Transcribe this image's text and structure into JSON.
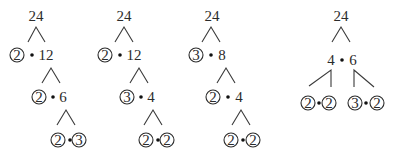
{
  "diagram": {
    "type": "factor-trees",
    "trees": [
      {
        "root": "24",
        "levels": [
          {
            "left": "2",
            "left_circled": true,
            "right": "12"
          },
          {
            "left": "2",
            "left_circled": true,
            "right": "6"
          },
          {
            "left": "2",
            "left_circled": true,
            "right": "3",
            "right_circled": true
          }
        ]
      },
      {
        "root": "24",
        "levels": [
          {
            "left": "2",
            "left_circled": true,
            "right": "12"
          },
          {
            "left": "3",
            "left_circled": true,
            "right": "4"
          },
          {
            "left": "2",
            "left_circled": true,
            "right": "2",
            "right_circled": true
          }
        ]
      },
      {
        "root": "24",
        "levels": [
          {
            "left": "3",
            "left_circled": true,
            "right": "8"
          },
          {
            "left": "2",
            "left_circled": true,
            "right": "4"
          },
          {
            "left": "2",
            "left_circled": true,
            "right": "2",
            "right_circled": true
          }
        ]
      },
      {
        "root": "24",
        "split": {
          "left": "4",
          "right": "6"
        },
        "left_factors": {
          "left": "2",
          "right": "2",
          "circled": true
        },
        "right_factors": {
          "left": "3",
          "right": "2",
          "circled": true
        }
      }
    ]
  }
}
